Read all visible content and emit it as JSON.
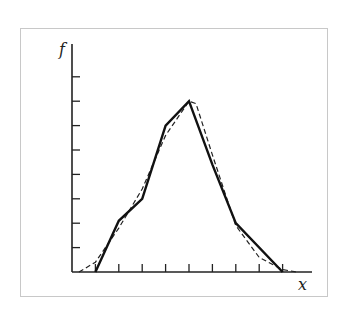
{
  "chart_data": {
    "type": "line",
    "title": "",
    "xlabel": "x",
    "ylabel": "f",
    "x_ticks": [
      1,
      2,
      3,
      4,
      5,
      6,
      7,
      8,
      9
    ],
    "y_ticks": [
      1,
      2,
      3,
      4,
      5,
      6,
      7,
      8
    ],
    "tick_labels_shown": false,
    "grid": false,
    "legend": null,
    "series": [
      {
        "name": "histogram polygon (solid)",
        "style": "solid",
        "x": [
          1,
          2,
          3,
          4,
          5,
          6,
          7,
          9
        ],
        "y": [
          0,
          2.1,
          3.0,
          6.0,
          7.0,
          4.4,
          2.0,
          0
        ]
      },
      {
        "name": "smooth fitted curve (dashed)",
        "style": "dashed",
        "x": [
          0.3,
          1,
          2,
          3,
          4,
          5,
          5.3,
          6,
          7,
          8,
          9,
          9.6
        ],
        "y": [
          0,
          0.4,
          1.8,
          3.4,
          5.6,
          7.0,
          6.9,
          4.8,
          1.9,
          0.6,
          0.1,
          0
        ]
      }
    ]
  },
  "labels": {
    "y_axis": "f",
    "x_axis": "x"
  }
}
